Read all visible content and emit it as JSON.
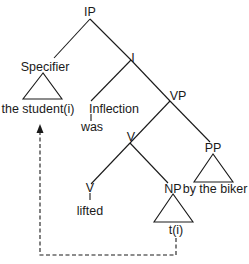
{
  "diagram": {
    "type": "syntax-tree",
    "nodes": {
      "ip": "IP",
      "specifier": "Specifier",
      "i_bar": "I",
      "inflection": "Inflection",
      "vp": "VP",
      "v_bar": "V",
      "pp": "PP",
      "v": "V",
      "np": "NP"
    },
    "leaves": {
      "specifier_text": "the student(i)",
      "inflection_text": "was",
      "v_text": "lifted",
      "pp_text": "by the biker",
      "np_text": "t(i)"
    },
    "edges": [
      {
        "from": "IP",
        "to": "Specifier"
      },
      {
        "from": "IP",
        "to": "I"
      },
      {
        "from": "I",
        "to": "Inflection"
      },
      {
        "from": "I",
        "to": "VP"
      },
      {
        "from": "VP",
        "to": "V'"
      },
      {
        "from": "VP",
        "to": "PP"
      },
      {
        "from": "V'",
        "to": "V"
      },
      {
        "from": "V'",
        "to": "NP"
      },
      {
        "from": "Inflection",
        "to": "was"
      },
      {
        "from": "V",
        "to": "lifted"
      }
    ],
    "triangles": [
      "Specifier",
      "PP",
      "NP"
    ],
    "movement_arrow": {
      "from": "t(i)",
      "to": "the student(i)",
      "style": "dashed"
    }
  }
}
